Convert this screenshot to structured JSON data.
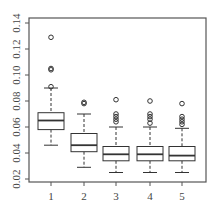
{
  "chart_data": {
    "type": "boxplot",
    "title": "",
    "xlabel": "",
    "ylabel": "",
    "categories": [
      "1",
      "2",
      "3",
      "4",
      "5"
    ],
    "ylim": [
      0.02,
      0.14
    ],
    "yticks": [
      "0.02",
      "0.04",
      "0.06",
      "0.08",
      "0.10",
      "0.12",
      "0.14"
    ],
    "grid": false,
    "legend": null,
    "boxes": [
      {
        "label": "1",
        "whisker_low": 0.046,
        "q1": 0.058,
        "median": 0.065,
        "q3": 0.071,
        "whisker_high": 0.09,
        "outliers": [
          0.129,
          0.105,
          0.104,
          0.091
        ]
      },
      {
        "label": "2",
        "whisker_low": 0.029,
        "q1": 0.041,
        "median": 0.046,
        "q3": 0.055,
        "whisker_high": 0.07,
        "outliers": [
          0.079,
          0.078
        ]
      },
      {
        "label": "3",
        "whisker_low": 0.025,
        "q1": 0.034,
        "median": 0.039,
        "q3": 0.045,
        "whisker_high": 0.06,
        "outliers": [
          0.081,
          0.07,
          0.068,
          0.066,
          0.064
        ]
      },
      {
        "label": "4",
        "whisker_low": 0.025,
        "q1": 0.034,
        "median": 0.039,
        "q3": 0.045,
        "whisker_high": 0.06,
        "outliers": [
          0.08,
          0.07,
          0.068,
          0.066,
          0.063
        ]
      },
      {
        "label": "5",
        "whisker_low": 0.025,
        "q1": 0.034,
        "median": 0.038,
        "q3": 0.045,
        "whisker_high": 0.059,
        "outliers": [
          0.078,
          0.068,
          0.066,
          0.064,
          0.062
        ]
      }
    ]
  },
  "colors": {
    "axis": "#555555",
    "box_stroke": "#333333",
    "outlier_stroke": "#333333"
  }
}
